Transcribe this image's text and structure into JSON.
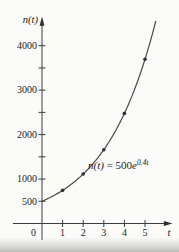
{
  "figure": {
    "y_axis_label": "n(t)",
    "x_axis_label": "t",
    "origin_label": "0",
    "equation": {
      "lhs": "n(t)",
      "equals_coefficient": " = 500",
      "base": "e",
      "exponent": "0.4t"
    },
    "colors": {
      "background": "#fbfbf9",
      "axis": "#3c3c3c",
      "curve": "#4a4a4a",
      "point": "#2e2e2e",
      "text": "#222222"
    }
  },
  "chart_data": {
    "type": "line",
    "xlabel": "t",
    "ylabel": "n(t)",
    "annotation": "n(t) = 500e^{0.4t}",
    "x_ticks": [
      1,
      2,
      3,
      4,
      5
    ],
    "y_ticks": [
      500,
      1000,
      1500,
      2000,
      2500,
      3000,
      3500,
      4000
    ],
    "y_labeled_ticks": [
      500,
      1000,
      2000,
      3000,
      4000
    ],
    "xlim": [
      0,
      5.9
    ],
    "ylim": [
      0,
      4600
    ],
    "grid": false,
    "legend": false,
    "curve": {
      "model": "n(t) = a*e^(k*t)",
      "a": 500,
      "k": 0.4,
      "t_start": 0,
      "t_end": 5.52
    },
    "points": [
      {
        "t": 1,
        "n": 746
      },
      {
        "t": 2,
        "n": 1113
      },
      {
        "t": 3,
        "n": 1660
      },
      {
        "t": 4,
        "n": 2477
      },
      {
        "t": 5,
        "n": 3695
      }
    ]
  }
}
